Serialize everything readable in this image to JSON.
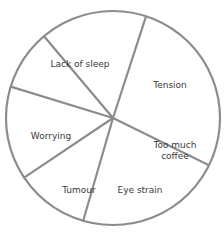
{
  "chart_data": {
    "type": "pie",
    "title": "",
    "categories": [
      "Lack of sleep",
      "Tension",
      "Too much coffee",
      "Eye strain",
      "Tumour",
      "Worrying"
    ],
    "values": [
      27,
      22,
      11,
      14,
      9,
      16
    ],
    "unit": "percent (estimated from slice angles)",
    "start_angle_deg": -72,
    "direction": "clockwise",
    "legend": "none (labels inside slices)",
    "slice_fill": "#ffffff",
    "line_color": "#8c8c8c",
    "label_color": "#3a3a3a"
  },
  "labels": {
    "lack_of_sleep": "Lack of sleep",
    "tension": "Tension",
    "coffee_line1": "Too much",
    "coffee_line2": "coffee",
    "eye_strain": "Eye strain",
    "tumour": "Tumour",
    "worrying": "Worrying"
  }
}
